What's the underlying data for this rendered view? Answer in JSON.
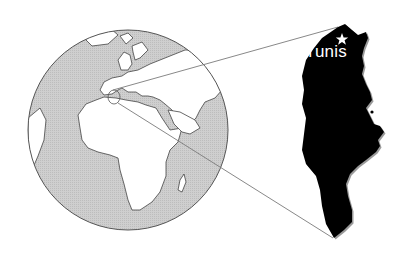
{
  "map": {
    "title": "Location of Tunisia",
    "capital": {
      "name": "Tunis",
      "marker": "star-icon"
    },
    "globe": {
      "ocean_color": "#c9c9c9",
      "land_color": "#ffffff",
      "outline_color": "#555555"
    },
    "country": {
      "name": "Tunisia",
      "fill": "#000000"
    },
    "leader_line_color": "#7a7a7a"
  }
}
